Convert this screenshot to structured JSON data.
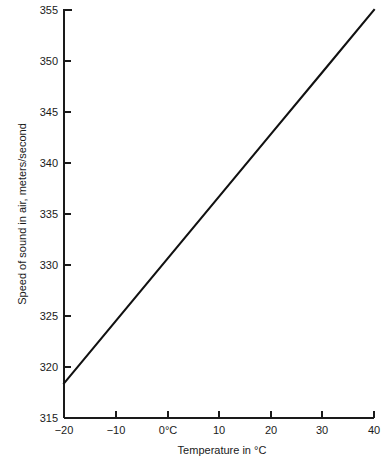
{
  "chart_data": {
    "type": "line",
    "title": "",
    "xlabel": "Temperature in °C",
    "ylabel": "Speed of sound in air, meters/second",
    "xlim": [
      -20,
      40
    ],
    "ylim": [
      315,
      355
    ],
    "grid": false,
    "legend": false,
    "x_ticks": [
      -20,
      -10,
      0,
      10,
      20,
      30,
      40
    ],
    "x_tick_labels": [
      "−20",
      "−10",
      "0°C",
      "10",
      "20",
      "30",
      "40"
    ],
    "y_ticks": [
      315,
      320,
      325,
      330,
      335,
      340,
      345,
      350,
      355
    ],
    "y_tick_labels": [
      "315",
      "320",
      "325",
      "330",
      "335",
      "340",
      "345",
      "350",
      "355"
    ],
    "series": [
      {
        "name": "Speed of sound in air",
        "color": "#111111",
        "x": [
          -20,
          -10,
          0,
          10,
          20,
          30,
          40
        ],
        "values": [
          318.4,
          324.5,
          330.6,
          336.7,
          342.8,
          348.9,
          355.0
        ]
      }
    ],
    "annotations": []
  },
  "axes": {
    "x_axis_name": "Temperature in °C",
    "y_axis_name": "Speed of sound in air, meters/second"
  }
}
